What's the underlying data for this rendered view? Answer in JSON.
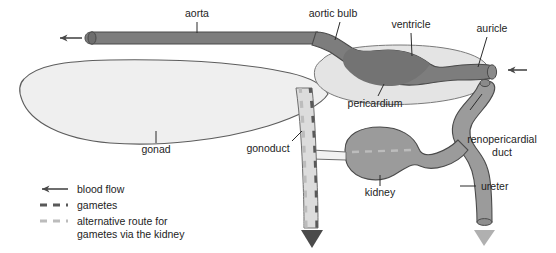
{
  "figure": {
    "width": 556,
    "height": 253
  },
  "colors": {
    "background": "#ffffff",
    "outline": "#4a4a4a",
    "outline_soft": "#6e6e6e",
    "heart_fill": "#7d7d7d",
    "aorta_fill": "#7d7d7d",
    "kidney_fill": "#9b9b9b",
    "duct_fill": "#9b9b9b",
    "gonad_fill": "#efefef",
    "pericardium_fill": "#e4e4e4",
    "gonoduct_fill": "#dcdcdc",
    "gametes_dash": "#595959",
    "alt_route_dash": "#bcbcbc",
    "arrow": "#4a4a4a",
    "arrow_light": "#b0b0b0",
    "text": "#1d1d1d",
    "leader": "#2b2b2b"
  },
  "labels": [
    {
      "name": "aorta",
      "text": "aorta",
      "x": 197,
      "y": 9,
      "align": "center"
    },
    {
      "name": "aortic-bulb",
      "text": "aortic bulb",
      "x": 333,
      "y": 9,
      "align": "center"
    },
    {
      "name": "ventricle",
      "text": "ventricle",
      "x": 405,
      "y": 20,
      "align": "center"
    },
    {
      "name": "auricle",
      "text": "auricle",
      "x": 491,
      "y": 24,
      "align": "center"
    },
    {
      "name": "pericardium",
      "text": "pericardium",
      "x": 371,
      "y": 100,
      "align": "center"
    },
    {
      "name": "gonad",
      "text": "gonad",
      "x": 156,
      "y": 143,
      "align": "center"
    },
    {
      "name": "gonoduct",
      "text": "gonoduct",
      "x": 270,
      "y": 145,
      "align": "center"
    },
    {
      "name": "kidney",
      "text": "kidney",
      "x": 374,
      "y": 187,
      "align": "center"
    },
    {
      "name": "ureter",
      "text": "ureter",
      "x": 481,
      "y": 183,
      "align": "left"
    }
  ],
  "multiline_labels": [
    {
      "name": "renopericardial-duct",
      "line1": "renopericardial",
      "line2": "duct",
      "x": 462,
      "y": 140
    }
  ],
  "legend": {
    "items": [
      {
        "name": "blood-flow",
        "swatch": "arrow",
        "text": "blood flow"
      },
      {
        "name": "gametes",
        "swatch": "dark-dash",
        "text": "gametes"
      },
      {
        "name": "alternative-route",
        "swatch": "light-dash",
        "text": "alternative route for",
        "text2": "gametes via the kidney"
      }
    ]
  },
  "flow_arrows": [
    {
      "name": "aorta-outflow-arrow",
      "direction": "left",
      "tone": "dark"
    },
    {
      "name": "auricle-inflow-arrow",
      "direction": "left",
      "tone": "dark"
    },
    {
      "name": "gonoduct-outflow-arrow",
      "direction": "down",
      "tone": "dark"
    },
    {
      "name": "ureter-outflow-arrow",
      "direction": "down",
      "tone": "light"
    }
  ]
}
